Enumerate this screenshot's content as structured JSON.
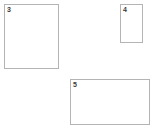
{
  "canvas": {
    "width": 155,
    "height": 138,
    "background_color": "#ffffff"
  },
  "style": {
    "border_color": "#b4b4b4",
    "fill_color": "#ffffff",
    "label_color": "#3a3a3a",
    "border_width_px": 1
  },
  "shapes": [
    {
      "label": "3",
      "kind": "rectangle",
      "x": 4,
      "y": 4,
      "width": 55,
      "height": 65
    },
    {
      "label": "4",
      "kind": "rectangle",
      "x": 120,
      "y": 4,
      "width": 23,
      "height": 39
    },
    {
      "label": "5",
      "kind": "rectangle",
      "x": 70,
      "y": 79,
      "width": 80,
      "height": 46
    }
  ]
}
